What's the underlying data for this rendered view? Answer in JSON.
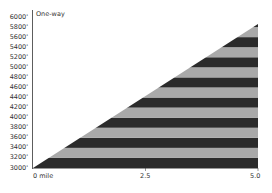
{
  "chart_data": {
    "type": "area",
    "title": "One-way",
    "xlabel": "",
    "ylabel": "",
    "x": [
      0,
      5.0
    ],
    "values": [
      3000,
      5800
    ],
    "xlim": [
      0,
      5.0
    ],
    "ylim": [
      3000,
      6000
    ],
    "x_tick_labels": [
      "0 mile",
      "2.5",
      "5.0"
    ],
    "y_tick_labels": [
      "6000'",
      "5800'",
      "5600'",
      "5400'",
      "5200'",
      "5000'",
      "4800'",
      "4600'",
      "4400'",
      "4200'",
      "4000'",
      "3800'",
      "3600'",
      "3400'",
      "3200'",
      "3000'"
    ],
    "band_interval": 200,
    "band_colors": [
      "#2b2b2b",
      "#a9a9a9"
    ],
    "grid": false,
    "legend": null
  }
}
